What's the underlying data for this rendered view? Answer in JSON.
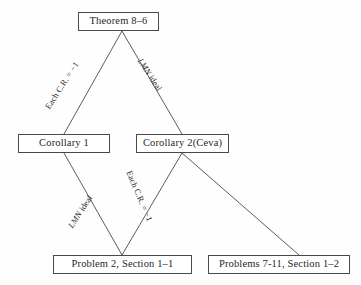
{
  "diagram": {
    "type": "lattice-flowchart",
    "ink_color": "#1f1f1f",
    "line_color": "#4a4a4a",
    "background_color": "#ffffff",
    "nodes": [
      {
        "id": "theorem",
        "label": "Theorem  8–6",
        "x": 78,
        "y": 12,
        "w": 81,
        "h": 19
      },
      {
        "id": "corollary1",
        "label": "Corollary   1",
        "x": 18,
        "y": 134,
        "w": 92,
        "h": 19
      },
      {
        "id": "corollary2",
        "label": "Corollary  2(Ceva)",
        "x": 136,
        "y": 134,
        "w": 93,
        "h": 19
      },
      {
        "id": "problem2",
        "label": "Problem  2, Section  1–1",
        "x": 53,
        "y": 255,
        "w": 139,
        "h": 19
      },
      {
        "id": "problems711",
        "label": "Problems  7-11, Section  1–2",
        "x": 208,
        "y": 255,
        "w": 142,
        "h": 19
      }
    ],
    "edges": [
      {
        "id": "theorem-to-corollary1",
        "from": "theorem",
        "to": "corollary1",
        "label_prefix": "Each C.R. ",
        "label_italic": "",
        "label_suffix": "= −1",
        "x1": 122,
        "y1": 31,
        "x2": 64,
        "y2": 134
      },
      {
        "id": "theorem-to-corollary2",
        "from": "theorem",
        "to": "corollary2",
        "label_prefix": "",
        "label_italic": "LMN",
        "label_suffix": " ideal",
        "x1": 122,
        "y1": 31,
        "x2": 182,
        "y2": 134
      },
      {
        "id": "corollary1-to-problem2",
        "from": "corollary1",
        "to": "problem2",
        "label_prefix": "",
        "label_italic": "LMN",
        "label_suffix": " ideal",
        "x1": 64,
        "y1": 153,
        "x2": 122,
        "y2": 255
      },
      {
        "id": "corollary2-to-problem2",
        "from": "corollary2",
        "to": "problem2",
        "label_prefix": "Each C.R. ",
        "label_italic": "",
        "label_suffix": "= −1",
        "x1": 182,
        "y1": 153,
        "x2": 122,
        "y2": 255
      },
      {
        "id": "corollary2-to-problems711",
        "from": "corollary2",
        "to": "problems711",
        "label_prefix": "",
        "label_italic": "",
        "label_suffix": "",
        "x1": 182,
        "y1": 153,
        "x2": 299,
        "y2": 255
      }
    ]
  }
}
